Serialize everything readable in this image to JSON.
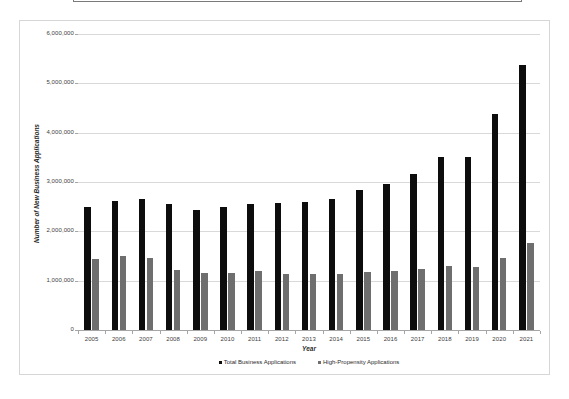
{
  "chart_data": {
    "type": "bar",
    "title": "",
    "xlabel": "Year",
    "ylabel": "Number of New Business Applications",
    "ylim": [
      0,
      6000000
    ],
    "ytick_values": [
      0,
      1000000,
      2000000,
      3000000,
      4000000,
      5000000,
      6000000
    ],
    "ytick_labels": [
      "0",
      "1,000,000",
      "2,000,000",
      "3,000,000",
      "4,000,000",
      "5,000,000",
      "6,000,000"
    ],
    "grid": true,
    "legend_position": "bottom",
    "categories": [
      "2005",
      "2006",
      "2007",
      "2008",
      "2009",
      "2010",
      "2011",
      "2012",
      "2013",
      "2014",
      "2015",
      "2016",
      "2017",
      "2018",
      "2019",
      "2020",
      "2021"
    ],
    "series": [
      {
        "name": "Total Business Applications",
        "color": "#0d0d0d",
        "values": [
          2500000,
          2620000,
          2660000,
          2550000,
          2430000,
          2500000,
          2560000,
          2580000,
          2600000,
          2660000,
          2830000,
          2960000,
          3170000,
          3500000,
          3510000,
          4380000,
          5370000
        ]
      },
      {
        "name": "High-Propensity Applications",
        "color": "#6e6e6e",
        "values": [
          1440000,
          1500000,
          1450000,
          1220000,
          1150000,
          1150000,
          1190000,
          1140000,
          1130000,
          1140000,
          1180000,
          1200000,
          1230000,
          1290000,
          1280000,
          1450000,
          1760000
        ]
      }
    ]
  }
}
